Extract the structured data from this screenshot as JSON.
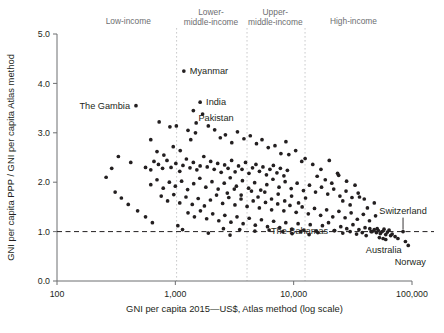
{
  "chart_data": {
    "type": "scatter",
    "title": "",
    "xlabel": "GNI per capita 2015—US$, Atlas method (log scale)",
    "ylabel": "GNI per capita PPP / GNI per capita Atlas method",
    "xscale": "log",
    "xlim": [
      100,
      100000
    ],
    "ylim": [
      0.0,
      5.0
    ],
    "xticks": [
      100,
      1000,
      10000,
      100000
    ],
    "xticklabels": [
      "100",
      "1,000",
      "10,000",
      "100,000"
    ],
    "yticks": [
      0.0,
      1.0,
      2.0,
      3.0,
      4.0,
      5.0
    ],
    "yticklabels": [
      "0.0",
      "1.0",
      "2.0",
      "3.0",
      "4.0",
      "5.0"
    ],
    "grid": false,
    "legend": null,
    "reference_lines": [
      {
        "orientation": "horizontal",
        "value": 1.0,
        "style": "dashed"
      }
    ],
    "group_dividers": [
      {
        "value": 1025,
        "style": "dotted"
      },
      {
        "value": 4035,
        "style": "dotted"
      },
      {
        "value": 12475,
        "style": "dotted"
      }
    ],
    "group_labels": [
      {
        "text": "Low-income",
        "x": 400
      },
      {
        "text": "Lower-\nmiddle-income",
        "x": 2000
      },
      {
        "text": "Upper-\nmiddle-income",
        "x": 7000
      },
      {
        "text": "High-income",
        "x": 32000
      }
    ],
    "annotations": [
      {
        "label": "Myanmar",
        "x": 1180,
        "y": 4.25,
        "anchor": "left"
      },
      {
        "label": "The Gambia",
        "x": 465,
        "y": 3.55,
        "anchor": "right"
      },
      {
        "label": "India",
        "x": 1620,
        "y": 3.62,
        "anchor": "left"
      },
      {
        "label": "Pakistan",
        "x": 1420,
        "y": 3.45,
        "anchor": "left-below"
      },
      {
        "label": "The Bahamas",
        "x": 22000,
        "y": 1.02,
        "anchor": "right"
      },
      {
        "label": "Switzerland",
        "x": 84000,
        "y": 1.0,
        "anchor": "leader-above"
      },
      {
        "label": "Australia",
        "x": 60000,
        "y": 0.84,
        "anchor": "below"
      },
      {
        "label": "Norway",
        "x": 93000,
        "y": 0.72,
        "anchor": "below-right"
      }
    ],
    "points": [
      [
        1180,
        4.25
      ],
      [
        465,
        3.55
      ],
      [
        1620,
        3.62
      ],
      [
        1420,
        3.45
      ],
      [
        730,
        3.22
      ],
      [
        620,
        2.86
      ],
      [
        900,
        3.12
      ],
      [
        1020,
        3.14
      ],
      [
        1280,
        3.05
      ],
      [
        1500,
        3.2
      ],
      [
        700,
        2.62
      ],
      [
        800,
        2.55
      ],
      [
        960,
        2.72
      ],
      [
        1100,
        2.64
      ],
      [
        330,
        2.52
      ],
      [
        420,
        2.4
      ],
      [
        560,
        2.3
      ],
      [
        620,
        2.25
      ],
      [
        660,
        2.42
      ],
      [
        720,
        2.36
      ],
      [
        780,
        2.28
      ],
      [
        850,
        2.44
      ],
      [
        920,
        2.3
      ],
      [
        1010,
        2.38
      ],
      [
        1090,
        2.22
      ],
      [
        1160,
        2.34
      ],
      [
        1240,
        2.47
      ],
      [
        1330,
        2.29
      ],
      [
        1420,
        2.4
      ],
      [
        1520,
        2.25
      ],
      [
        1620,
        2.33
      ],
      [
        1740,
        2.52
      ],
      [
        1860,
        2.31
      ],
      [
        1990,
        2.42
      ],
      [
        2130,
        2.26
      ],
      [
        2280,
        2.38
      ],
      [
        2440,
        2.2
      ],
      [
        2610,
        2.35
      ],
      [
        2790,
        2.28
      ],
      [
        2990,
        2.44
      ],
      [
        3200,
        2.21
      ],
      [
        3420,
        2.33
      ],
      [
        3660,
        2.26
      ],
      [
        3920,
        2.4
      ],
      [
        4190,
        2.18
      ],
      [
        4490,
        2.29
      ],
      [
        4800,
        2.36
      ],
      [
        5140,
        2.22
      ],
      [
        5500,
        2.31
      ],
      [
        5890,
        2.15
      ],
      [
        6300,
        2.26
      ],
      [
        6740,
        2.34
      ],
      [
        7220,
        2.19
      ],
      [
        7720,
        2.28
      ],
      [
        8270,
        2.13
      ],
      [
        8850,
        2.24
      ],
      [
        620,
        1.95
      ],
      [
        700,
        2.05
      ],
      [
        790,
        1.88
      ],
      [
        890,
        2.0
      ],
      [
        1000,
        1.92
      ],
      [
        1130,
        2.02
      ],
      [
        1270,
        1.85
      ],
      [
        1430,
        1.97
      ],
      [
        1610,
        2.08
      ],
      [
        1810,
        1.9
      ],
      [
        2040,
        2.01
      ],
      [
        2300,
        1.86
      ],
      [
        2590,
        1.98
      ],
      [
        2910,
        2.09
      ],
      [
        3280,
        1.92
      ],
      [
        3690,
        2.03
      ],
      [
        4160,
        1.88
      ],
      [
        4680,
        1.99
      ],
      [
        5270,
        1.84
      ],
      [
        5930,
        1.95
      ],
      [
        6680,
        2.06
      ],
      [
        7520,
        1.9
      ],
      [
        8470,
        2.01
      ],
      [
        9530,
        1.87
      ],
      [
        10700,
        1.98
      ],
      [
        12100,
        1.83
      ],
      [
        13600,
        1.94
      ],
      [
        15300,
        1.8
      ],
      [
        17200,
        1.9
      ],
      [
        19400,
        1.76
      ],
      [
        21800,
        1.86
      ],
      [
        24600,
        1.72
      ],
      [
        27700,
        1.82
      ],
      [
        31100,
        1.69
      ],
      [
        35100,
        1.78
      ],
      [
        39500,
        1.66
      ],
      [
        760,
        1.72
      ],
      [
        860,
        1.62
      ],
      [
        970,
        1.75
      ],
      [
        1090,
        1.58
      ],
      [
        1230,
        1.7
      ],
      [
        1390,
        1.55
      ],
      [
        1560,
        1.67
      ],
      [
        1760,
        1.52
      ],
      [
        1980,
        1.64
      ],
      [
        2230,
        1.74
      ],
      [
        2510,
        1.57
      ],
      [
        2830,
        1.69
      ],
      [
        3190,
        1.54
      ],
      [
        3590,
        1.66
      ],
      [
        4040,
        1.51
      ],
      [
        4550,
        1.62
      ],
      [
        5130,
        1.48
      ],
      [
        5780,
        1.59
      ],
      [
        6510,
        1.44
      ],
      [
        7330,
        1.56
      ],
      [
        8260,
        1.42
      ],
      [
        9300,
        1.53
      ],
      [
        10500,
        1.39
      ],
      [
        11800,
        1.5
      ],
      [
        13300,
        1.36
      ],
      [
        15000,
        1.47
      ],
      [
        16900,
        1.33
      ],
      [
        19000,
        1.44
      ],
      [
        21400,
        1.3
      ],
      [
        24100,
        1.41
      ],
      [
        27200,
        1.28
      ],
      [
        30600,
        1.38
      ],
      [
        34500,
        1.25
      ],
      [
        38800,
        1.35
      ],
      [
        43700,
        1.22
      ],
      [
        49200,
        1.32
      ],
      [
        1280,
        1.38
      ],
      [
        1450,
        1.3
      ],
      [
        1630,
        1.42
      ],
      [
        1840,
        1.26
      ],
      [
        2070,
        1.36
      ],
      [
        2330,
        1.22
      ],
      [
        2620,
        1.33
      ],
      [
        2950,
        1.19
      ],
      [
        3320,
        1.3
      ],
      [
        3740,
        1.16
      ],
      [
        4210,
        1.27
      ],
      [
        4740,
        1.13
      ],
      [
        5340,
        1.24
      ],
      [
        6010,
        1.1
      ],
      [
        6770,
        1.21
      ],
      [
        7620,
        1.08
      ],
      [
        8580,
        1.18
      ],
      [
        9660,
        1.05
      ],
      [
        10900,
        1.16
      ],
      [
        12200,
        1.03
      ],
      [
        13800,
        1.14
      ],
      [
        15500,
        1.01
      ],
      [
        17500,
        1.12
      ],
      [
        19700,
        1.18
      ],
      [
        22200,
        1.02
      ],
      [
        25000,
        1.1
      ],
      [
        28100,
        1.06
      ],
      [
        31700,
        1.14
      ],
      [
        35600,
        1.04
      ],
      [
        40100,
        1.08
      ],
      [
        45100,
        1.0
      ],
      [
        50800,
        1.06
      ],
      [
        2550,
        1.06
      ],
      [
        3500,
        1.04
      ],
      [
        4700,
        1.01
      ],
      [
        6200,
        1.03
      ],
      [
        8100,
        1.0
      ],
      [
        44000,
        1.06
      ],
      [
        46000,
        1.0
      ],
      [
        48000,
        1.04
      ],
      [
        50000,
        0.98
      ],
      [
        52000,
        1.02
      ],
      [
        54000,
        0.96
      ],
      [
        56000,
        1.0
      ],
      [
        58000,
        1.05
      ],
      [
        60000,
        0.94
      ],
      [
        62000,
        0.99
      ],
      [
        64000,
        1.03
      ],
      [
        66000,
        0.92
      ],
      [
        53000,
        0.88
      ],
      [
        57000,
        0.86
      ],
      [
        60000,
        0.84
      ],
      [
        68000,
        0.95
      ],
      [
        72000,
        0.9
      ],
      [
        76000,
        0.86
      ],
      [
        84000,
        1.0
      ],
      [
        88000,
        0.8
      ],
      [
        93000,
        0.72
      ],
      [
        22000,
        1.02
      ],
      [
        26000,
        0.97
      ],
      [
        30000,
        1.0
      ],
      [
        34000,
        0.95
      ],
      [
        38000,
        0.98
      ],
      [
        41000,
        0.92
      ],
      [
        9700,
        0.96
      ],
      [
        11500,
        1.0
      ],
      [
        13500,
        0.94
      ],
      [
        16000,
        0.98
      ],
      [
        1900,
        0.97
      ],
      [
        2900,
        0.93
      ],
      [
        640,
        1.18
      ],
      [
        560,
        1.3
      ],
      [
        480,
        1.42
      ],
      [
        400,
        1.55
      ],
      [
        350,
        1.68
      ],
      [
        310,
        1.8
      ],
      [
        260,
        2.1
      ],
      [
        290,
        2.28
      ],
      [
        1050,
        1.12
      ],
      [
        1150,
        1.04
      ],
      [
        15800,
        2.12
      ],
      [
        18500,
        2.05
      ],
      [
        21000,
        1.98
      ],
      [
        24000,
        2.14
      ],
      [
        28000,
        2.02
      ],
      [
        33000,
        1.94
      ],
      [
        12500,
        2.48
      ],
      [
        14500,
        2.36
      ],
      [
        17000,
        2.26
      ],
      [
        20000,
        2.44
      ],
      [
        23500,
        2.18
      ],
      [
        9100,
        2.56
      ],
      [
        10400,
        2.64
      ],
      [
        11700,
        2.42
      ],
      [
        6950,
        2.74
      ],
      [
        7800,
        2.58
      ],
      [
        8600,
        2.82
      ],
      [
        5400,
        2.86
      ],
      [
        6100,
        2.7
      ],
      [
        4300,
        2.94
      ],
      [
        4850,
        2.78
      ],
      [
        3350,
        3.02
      ],
      [
        3800,
        2.88
      ],
      [
        2650,
        2.96
      ],
      [
        3000,
        2.8
      ],
      [
        2150,
        3.06
      ],
      [
        2400,
        2.9
      ],
      [
        1700,
        3.38
      ],
      [
        1900,
        3.14
      ],
      [
        1350,
        2.86
      ],
      [
        1480,
        3.0
      ],
      [
        26000,
        1.62
      ],
      [
        30000,
        1.54
      ],
      [
        36000,
        1.7
      ],
      [
        42000,
        1.48
      ],
      [
        48000,
        1.58
      ],
      [
        2750,
        1.78
      ],
      [
        3150,
        1.86
      ],
      [
        3600,
        1.74
      ],
      [
        4400,
        1.82
      ],
      [
        5000,
        1.7
      ],
      [
        5700,
        1.8
      ],
      [
        6500,
        1.66
      ],
      [
        7400,
        1.76
      ],
      [
        8400,
        1.62
      ],
      [
        9600,
        1.72
      ],
      [
        11000,
        1.58
      ],
      [
        12600,
        1.68
      ]
    ]
  }
}
